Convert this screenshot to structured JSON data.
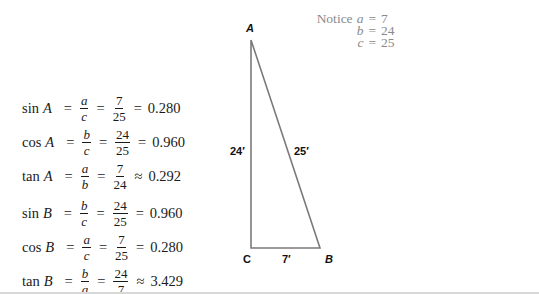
{
  "notice": {
    "label": "Notice",
    "rows": [
      {
        "var": "a",
        "eq": "=",
        "value": "7"
      },
      {
        "var": "b",
        "eq": "=",
        "value": "24"
      },
      {
        "var": "c",
        "eq": "=",
        "value": "25"
      }
    ]
  },
  "equations": [
    {
      "fn": "sin",
      "angle": "A",
      "eq1": "=",
      "ratio_num": "a",
      "ratio_den": "c",
      "eq2": "=",
      "frac_num": "7",
      "frac_den": "25",
      "eq3": "=",
      "result": "0.280"
    },
    {
      "fn": "cos",
      "angle": "A",
      "eq1": "=",
      "ratio_num": "b",
      "ratio_den": "c",
      "eq2": "=",
      "frac_num": "24",
      "frac_den": "25",
      "eq3": "=",
      "result": "0.960"
    },
    {
      "fn": "tan",
      "angle": "A",
      "eq1": "=",
      "ratio_num": "a",
      "ratio_den": "b",
      "eq2": "=",
      "frac_num": "7",
      "frac_den": "24",
      "eq3": "≈",
      "result": "0.292"
    },
    {
      "fn": "sin",
      "angle": "B",
      "eq1": "=",
      "ratio_num": "b",
      "ratio_den": "c",
      "eq2": "=",
      "frac_num": "24",
      "frac_den": "25",
      "eq3": "=",
      "result": "0.960"
    },
    {
      "fn": "cos",
      "angle": "B",
      "eq1": "=",
      "ratio_num": "a",
      "ratio_den": "c",
      "eq2": "=",
      "frac_num": "7",
      "frac_den": "25",
      "eq3": "=",
      "result": "0.280"
    },
    {
      "fn": "tan",
      "angle": "B",
      "eq1": "=",
      "ratio_num": "b",
      "ratio_den": "a",
      "eq2": "=",
      "frac_num": "24",
      "frac_den": "7",
      "eq3": "≈",
      "result": "3.429"
    }
  ],
  "triangle": {
    "vertices": {
      "A": "A",
      "B": "B",
      "C": "C"
    },
    "sides": {
      "AC": "24′",
      "AB": "25′",
      "CB": "7′"
    },
    "stroke_color": "#7a7a7a"
  }
}
